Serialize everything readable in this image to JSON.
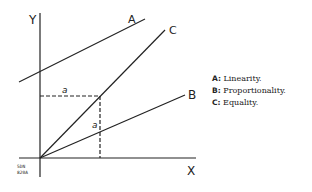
{
  "diagram": {
    "axes": {
      "x_label": "X",
      "y_label": "Y"
    },
    "lines": [
      {
        "id": "A",
        "label": "A"
      },
      {
        "id": "B",
        "label": "B"
      },
      {
        "id": "C",
        "label": "C"
      }
    ],
    "segment_labels": [
      "a",
      "a"
    ],
    "legend": [
      {
        "key": "A:",
        "text": "Linearity."
      },
      {
        "key": "B:",
        "text": "Proportionality."
      },
      {
        "key": "C:",
        "text": "Equality."
      }
    ],
    "corner_code": [
      "5DN",
      "820A"
    ],
    "colors": {
      "ink": "#222222",
      "background": "#ffffff"
    }
  }
}
